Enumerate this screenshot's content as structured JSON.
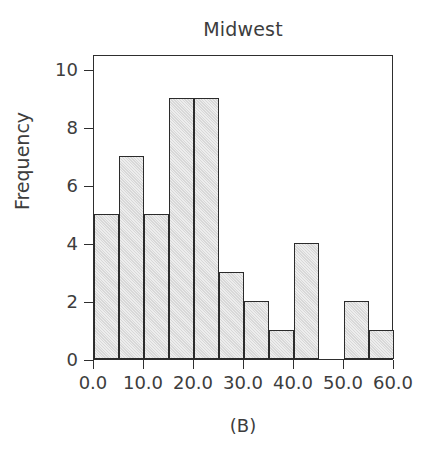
{
  "chart_data": {
    "type": "bar",
    "title": "Midwest",
    "xlabel": "",
    "ylabel": "Frequency",
    "caption": "(B)",
    "bin_width": 5,
    "categories": [
      "0-5",
      "5-10",
      "10-15",
      "15-20",
      "20-25",
      "25-30",
      "30-35",
      "35-40",
      "40-45",
      "45-50",
      "50-55",
      "55-60"
    ],
    "bin_edges": [
      0,
      5,
      10,
      15,
      20,
      25,
      30,
      35,
      40,
      45,
      50,
      55,
      60
    ],
    "values": [
      5,
      7,
      5,
      9,
      9,
      3,
      2,
      1,
      4,
      0,
      2,
      1
    ],
    "xlim": [
      0,
      60
    ],
    "ylim": [
      0,
      10.5
    ],
    "x_ticks": [
      0,
      10,
      20,
      30,
      40,
      50,
      60
    ],
    "x_tick_labels": [
      "0.0",
      "10.0",
      "20.0",
      "30.0",
      "40.0",
      "50.0",
      "60.0"
    ],
    "y_ticks": [
      0,
      2,
      4,
      6,
      8,
      10
    ],
    "y_tick_labels": [
      "0",
      "2",
      "4",
      "6",
      "8",
      "10"
    ],
    "grid": false,
    "legend": null,
    "bar_fill_color": "#d8d8d8",
    "bar_edge_color": "#2b2b2b",
    "axis_color": "#2e2e2e",
    "text_color": "#3d3d3d",
    "background_color": "#ffffff"
  }
}
